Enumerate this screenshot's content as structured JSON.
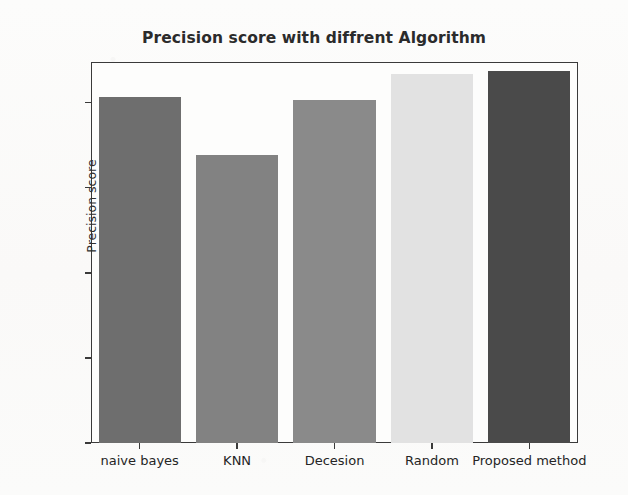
{
  "chart_data": {
    "type": "bar",
    "title": "Precision score with diffrent Algorithm",
    "xlabel": "",
    "ylabel": "Precision score",
    "categories": [
      "naive bayes",
      "KNN",
      "Decesion",
      "Random",
      "Proposed method"
    ],
    "values": [
      0.812,
      0.676,
      0.805,
      0.868,
      0.873
    ],
    "bar_colors": [
      "#6e6e6e",
      "#828282",
      "#8a8a8a",
      "#e2e2e2",
      "#4a4a4a"
    ],
    "ylim": [
      0.0,
      0.895
    ],
    "yticks": [
      0.0,
      0.2,
      0.4,
      0.6,
      0.8
    ],
    "ytick_labels": [
      "0.0",
      "0.2",
      "0.4",
      "0.6",
      "0.8"
    ],
    "grid": false,
    "legend": false,
    "legend_position": "none"
  },
  "figure": {
    "background_color": "#fbfbfa",
    "axes_color": "#3a3a3a",
    "text_color": "#2b2b2b"
  }
}
